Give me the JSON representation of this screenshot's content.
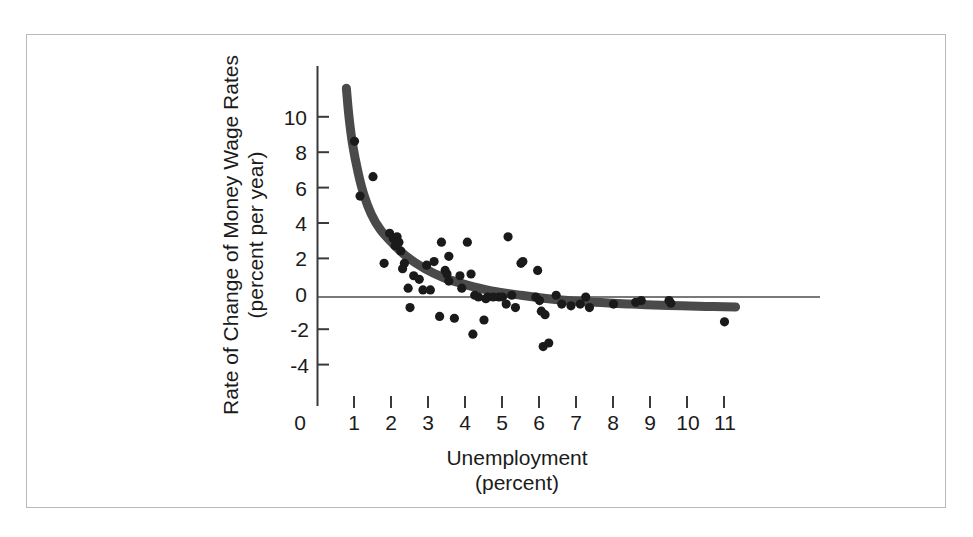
{
  "chart_data": {
    "type": "scatter",
    "title": "",
    "xlabel": "Unemployment",
    "xlabel_units": "(percent)",
    "ylabel": "Rate of Change of Money Wage Rates",
    "ylabel_units": "(percent per year)",
    "xlim": [
      0,
      11.6
    ],
    "ylim": [
      -5.2,
      11.8
    ],
    "xticks": [
      0,
      1,
      2,
      3,
      4,
      5,
      6,
      7,
      8,
      9,
      10,
      11
    ],
    "xtick_labels": [
      "0",
      "1",
      "2",
      "3",
      "4",
      "5",
      "6",
      "7",
      "8",
      "9",
      "10",
      "11"
    ],
    "yticks": [
      -4,
      -2,
      0,
      2,
      4,
      6,
      8,
      10
    ],
    "ytick_labels": [
      "-4",
      "-2",
      "0",
      "2",
      "4",
      "6",
      "8",
      "10"
    ],
    "grid": false,
    "legend": "none",
    "zero_line": 0,
    "marker_color": "#1a1a1a",
    "curve_color": "#4a4a4a",
    "axis_color": "#3a3a3a",
    "series": [
      {
        "name": "Observations",
        "marker": "filled-circle",
        "points": [
          [
            1.0,
            8.8
          ],
          [
            1.15,
            5.7
          ],
          [
            1.5,
            6.8
          ],
          [
            1.95,
            3.6
          ],
          [
            2.05,
            3.3
          ],
          [
            2.1,
            2.9
          ],
          [
            2.15,
            3.4
          ],
          [
            2.2,
            3.1
          ],
          [
            2.25,
            2.6
          ],
          [
            1.8,
            1.9
          ],
          [
            2.35,
            1.9
          ],
          [
            2.3,
            1.6
          ],
          [
            2.45,
            0.5
          ],
          [
            2.5,
            -0.6
          ],
          [
            2.6,
            1.2
          ],
          [
            2.75,
            1.0
          ],
          [
            2.85,
            0.4
          ],
          [
            3.05,
            0.4
          ],
          [
            2.95,
            1.8
          ],
          [
            3.15,
            2.0
          ],
          [
            3.35,
            3.1
          ],
          [
            3.45,
            1.5
          ],
          [
            3.5,
            1.3
          ],
          [
            3.55,
            0.9
          ],
          [
            3.3,
            -1.1
          ],
          [
            3.7,
            -1.2
          ],
          [
            3.55,
            2.3
          ],
          [
            3.85,
            1.2
          ],
          [
            3.9,
            0.5
          ],
          [
            4.05,
            3.1
          ],
          [
            4.15,
            1.3
          ],
          [
            4.25,
            0.1
          ],
          [
            4.35,
            0.0
          ],
          [
            4.55,
            -0.1
          ],
          [
            4.2,
            -2.1
          ],
          [
            4.6,
            0.0
          ],
          [
            4.75,
            0.0
          ],
          [
            4.9,
            0.0
          ],
          [
            5.0,
            0.0
          ],
          [
            5.1,
            -0.4
          ],
          [
            5.15,
            3.4
          ],
          [
            5.25,
            0.1
          ],
          [
            5.35,
            -0.6
          ],
          [
            4.5,
            -1.3
          ],
          [
            5.5,
            1.9
          ],
          [
            5.55,
            2.0
          ],
          [
            5.95,
            1.5
          ],
          [
            5.9,
            0.0
          ],
          [
            6.0,
            -0.2
          ],
          [
            6.05,
            -0.8
          ],
          [
            6.15,
            -1.0
          ],
          [
            6.1,
            -2.8
          ],
          [
            6.25,
            -2.6
          ],
          [
            6.45,
            0.1
          ],
          [
            6.6,
            -0.4
          ],
          [
            6.85,
            -0.5
          ],
          [
            7.1,
            -0.4
          ],
          [
            7.25,
            0.0
          ],
          [
            7.35,
            -0.6
          ],
          [
            8.0,
            -0.4
          ],
          [
            8.6,
            -0.3
          ],
          [
            8.75,
            -0.2
          ],
          [
            9.5,
            -0.2
          ],
          [
            9.55,
            -0.35
          ],
          [
            11.0,
            -1.4
          ]
        ]
      }
    ],
    "fitted_curve": {
      "name": "Phillips curve (fitted)",
      "style": "thick-smooth",
      "points": [
        [
          0.78,
          11.8
        ],
        [
          0.85,
          10.2
        ],
        [
          0.95,
          8.6
        ],
        [
          1.1,
          7.0
        ],
        [
          1.25,
          5.8
        ],
        [
          1.45,
          4.7
        ],
        [
          1.7,
          3.8
        ],
        [
          2.0,
          3.1
        ],
        [
          2.4,
          2.3
        ],
        [
          2.9,
          1.6
        ],
        [
          3.4,
          1.1
        ],
        [
          4.0,
          0.7
        ],
        [
          4.7,
          0.35
        ],
        [
          5.5,
          0.1
        ],
        [
          6.5,
          -0.15
        ],
        [
          7.5,
          -0.3
        ],
        [
          8.5,
          -0.4
        ],
        [
          9.5,
          -0.48
        ],
        [
          10.5,
          -0.53
        ],
        [
          11.3,
          -0.56
        ]
      ]
    }
  },
  "axis_titles": {
    "x_line1": "Unemployment",
    "x_line2": "(percent)",
    "y_line1": "Rate of Change of Money Wage Rates",
    "y_line2": "(percent per year)"
  }
}
